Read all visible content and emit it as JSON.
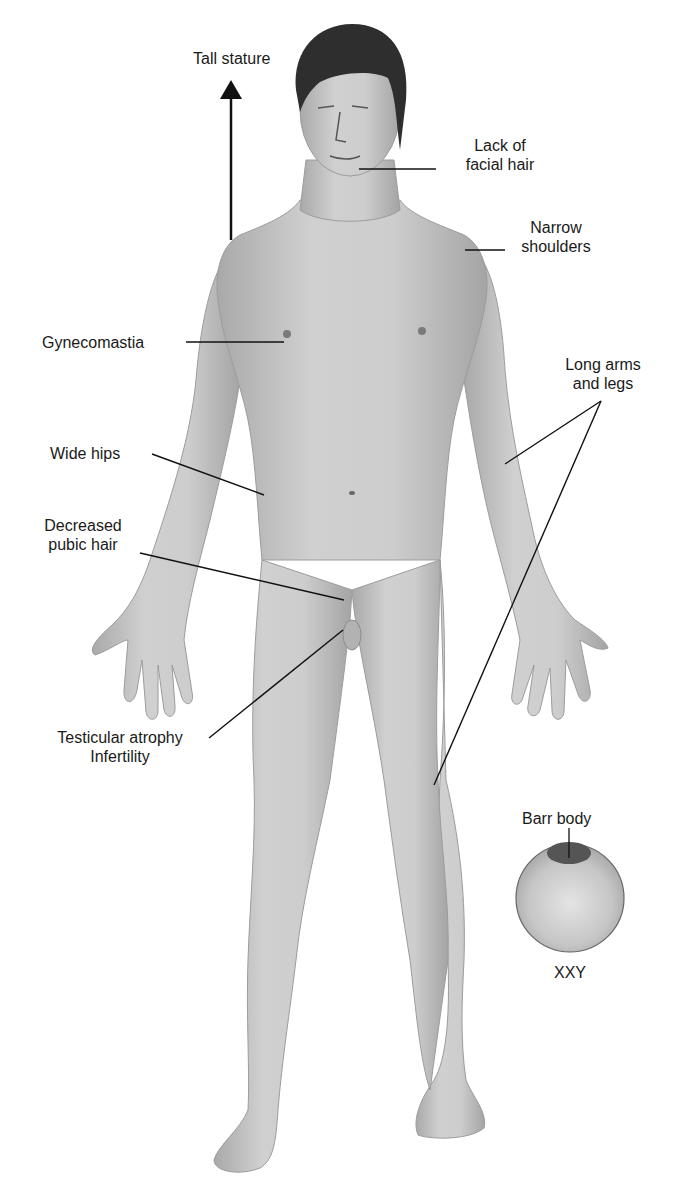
{
  "diagram": {
    "colors": {
      "background": "#ffffff",
      "skin_light": "#d4d4d4",
      "skin_mid": "#b8b8b8",
      "skin_shadow": "#9a9a9a",
      "hair": "#2a2a2a",
      "text": "#1a1a1a",
      "leader_line": "#111111",
      "cell": "#c8c8c8",
      "barr_body": "#555555"
    },
    "labels": {
      "tall_stature": "Tall stature",
      "lack_facial_hair_1": "Lack of",
      "lack_facial_hair_2": "facial hair",
      "narrow_shoulders_1": "Narrow",
      "narrow_shoulders_2": "shoulders",
      "gynecomastia": "Gynecomastia",
      "long_limbs_1": "Long arms",
      "long_limbs_2": "and legs",
      "wide_hips": "Wide hips",
      "pubic_hair_1": "Decreased",
      "pubic_hair_2": "pubic hair",
      "testicular_1": "Testicular atrophy",
      "testicular_2": "Infertility",
      "barr_body": "Barr body",
      "karyotype": "XXY"
    }
  }
}
